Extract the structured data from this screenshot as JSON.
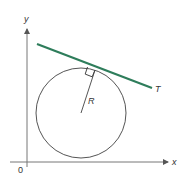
{
  "diagram": {
    "title": "",
    "axes": {
      "x_label": "x",
      "y_label": "y",
      "origin_label": "0"
    },
    "circle": {
      "radius_label": "R",
      "stroke_color": "#555555"
    },
    "tangent": {
      "label": "T",
      "color": "#2e7d5b"
    },
    "right_angle_marker": true
  }
}
